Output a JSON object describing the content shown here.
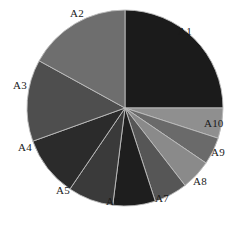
{
  "chart_data": {
    "type": "pie",
    "title": "",
    "subtitle": "",
    "xlabel": "",
    "ylabel": "",
    "grid": false,
    "legend_position": "none",
    "label_placement": "outside",
    "start_angle_deg": 0,
    "direction": "clockwise",
    "center": {
      "x": 125,
      "y": 108
    },
    "radius": 98,
    "categories": [
      "A1",
      "A2",
      "A3",
      "A4",
      "A5",
      "A6",
      "A7",
      "A8",
      "A9",
      "A10"
    ],
    "values": [
      25.0,
      17.0,
      13.5,
      10.0,
      7.5,
      7.0,
      5.5,
      5.0,
      4.5,
      5.0
    ],
    "slices": [
      {
        "label": "A1",
        "value": 25.0,
        "start_deg": 0.0,
        "end_deg": 90.0,
        "color": "#1b1b1b",
        "label_x": 178,
        "label_y": 26
      },
      {
        "label": "A10",
        "value": 5.0,
        "start_deg": 90.0,
        "end_deg": 108.0,
        "color": "#8f8f8f",
        "label_x": 204,
        "label_y": 118
      },
      {
        "label": "A9",
        "value": 4.5,
        "start_deg": 108.0,
        "end_deg": 124.2,
        "color": "#6a6a6a",
        "label_x": 211,
        "label_y": 147
      },
      {
        "label": "A8",
        "value": 5.0,
        "start_deg": 124.2,
        "end_deg": 142.2,
        "color": "#8a8a8a",
        "label_x": 193,
        "label_y": 176
      },
      {
        "label": "A7",
        "value": 5.5,
        "start_deg": 142.2,
        "end_deg": 162.0,
        "color": "#565656",
        "label_x": 155,
        "label_y": 193
      },
      {
        "label": "A6",
        "value": 7.0,
        "start_deg": 162.0,
        "end_deg": 187.2,
        "color": "#1e1e1e",
        "label_x": 106,
        "label_y": 196
      },
      {
        "label": "A5",
        "value": 7.5,
        "start_deg": 187.2,
        "end_deg": 214.2,
        "color": "#3a3a3a",
        "label_x": 56,
        "label_y": 185
      },
      {
        "label": "A4",
        "value": 10.0,
        "start_deg": 214.2,
        "end_deg": 250.2,
        "color": "#2b2b2b",
        "label_x": 18,
        "label_y": 142
      },
      {
        "label": "A3",
        "value": 13.5,
        "start_deg": 250.2,
        "end_deg": 298.8,
        "color": "#4e4e4e",
        "label_x": 13,
        "label_y": 80
      },
      {
        "label": "A2",
        "value": 17.0,
        "start_deg": 298.8,
        "end_deg": 360.0,
        "color": "#6e6e6e",
        "label_x": 70,
        "label_y": 8
      }
    ],
    "background_color": "#ffffff",
    "edge_color": "#bdbdbd"
  },
  "labels": {
    "a1": "A1",
    "a2": "A2",
    "a3": "A3",
    "a4": "A4",
    "a5": "A5",
    "a6": "A6",
    "a7": "A7",
    "a8": "A8",
    "a9": "A9",
    "a10": "A10"
  },
  "caption": {
    "text": ""
  }
}
